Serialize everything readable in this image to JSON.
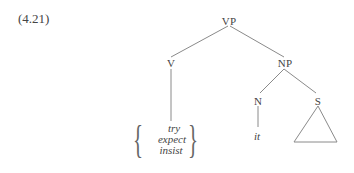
{
  "example_number": "(4.21)",
  "tree": {
    "root": "VP",
    "nodes": {
      "vp": "VP",
      "v": "V",
      "np": "NP",
      "n": "N",
      "s": "S"
    },
    "leaves": {
      "verb_alternatives": [
        "try",
        "expect",
        "insist"
      ],
      "n_word": "it"
    },
    "triangle_under": "S"
  },
  "colors": {
    "line": "#888888",
    "text": "#444444"
  }
}
